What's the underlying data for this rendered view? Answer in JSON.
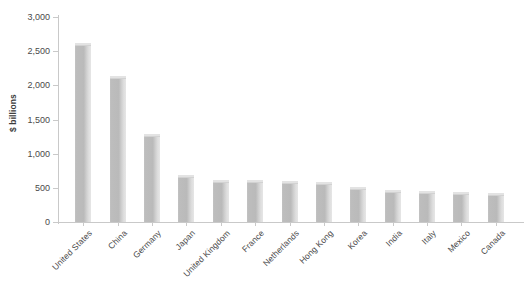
{
  "chart_data": {
    "type": "bar",
    "title": "",
    "subtitle": "",
    "xlabel": "",
    "ylabel": "$ billions",
    "ylim": [
      0,
      3000
    ],
    "ytick_step": 500,
    "grid": false,
    "legend": null,
    "orientation": "vertical",
    "bar_color": "#bcbcbc",
    "bar_top_color": "#e3e3e3",
    "axis_color": "#c9c9c9",
    "text_color": "#4a4a4a",
    "background_color": "#ffffff",
    "ytick_labels": [
      "3,000",
      "2,500",
      "2,000",
      "1,500",
      "1,000",
      "500",
      "0"
    ],
    "ytick_values": [
      3000,
      2500,
      2000,
      1500,
      1000,
      500,
      0
    ],
    "categories": [
      "United States",
      "China",
      "Germany",
      "Japan",
      "United Kingdom",
      "France",
      "Netherlands",
      "Hong Kong",
      "Korea",
      "India",
      "Italy",
      "Mexico",
      "Canada"
    ],
    "values": [
      2625,
      2140,
      1290,
      690,
      620,
      620,
      600,
      585,
      515,
      470,
      455,
      440,
      425
    ]
  }
}
